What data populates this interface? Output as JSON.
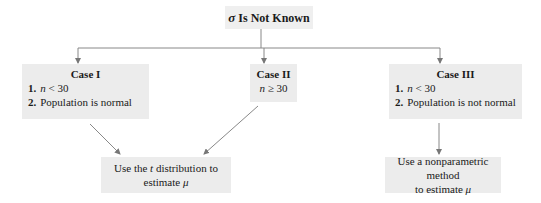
{
  "title": {
    "symbol": "σ",
    "text": "Is Not Known"
  },
  "cases": [
    {
      "heading": "Case I",
      "items": [
        {
          "num": "1.",
          "var": "n",
          "rel": " < 30"
        },
        {
          "num": "2.",
          "text": "Population is normal"
        }
      ]
    },
    {
      "heading": "Case II",
      "var": "n",
      "rel": " ≥ 30"
    },
    {
      "heading": "Case III",
      "items": [
        {
          "num": "1.",
          "var": "n",
          "rel": " < 30"
        },
        {
          "num": "2.",
          "text": "Population is not normal"
        }
      ]
    }
  ],
  "results": [
    {
      "line1_pre": "Use the ",
      "line1_var": "t",
      "line1_post": " distribution to",
      "line2_pre": "estimate ",
      "line2_var": "μ"
    },
    {
      "line1": "Use a nonparametric method",
      "line2_pre": "to estimate ",
      "line2_var": "μ"
    }
  ],
  "colors": {
    "box_fill": "#ececec",
    "line": "#888888"
  }
}
